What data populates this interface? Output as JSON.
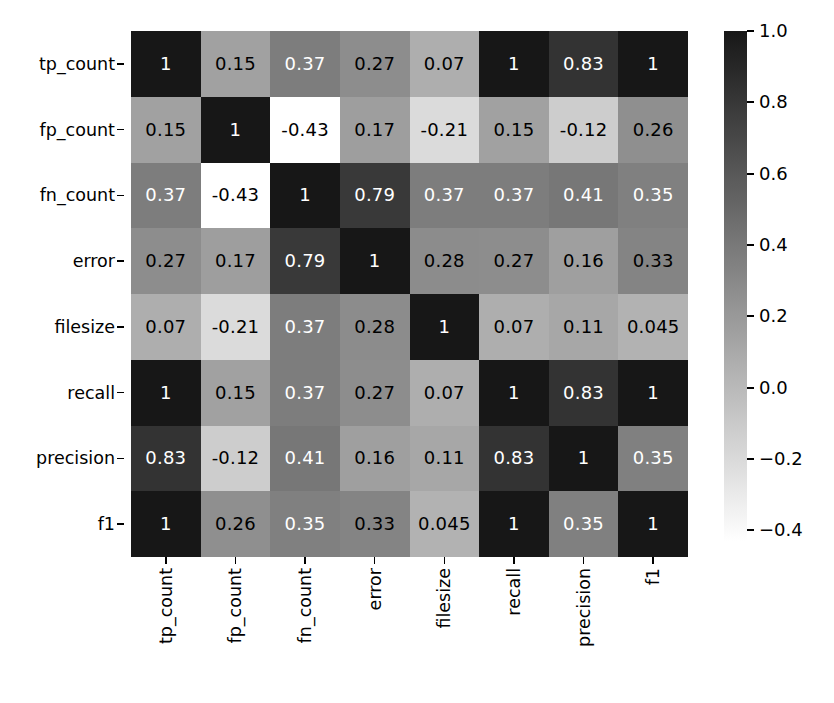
{
  "chart_data": {
    "type": "heatmap",
    "title": "",
    "xlabel": "",
    "ylabel": "",
    "grid": false,
    "colormap": "gray_r",
    "legend_position": "right",
    "categories": [
      "tp_count",
      "fp_count",
      "fn_count",
      "error",
      "filesize",
      "recall",
      "precision",
      "f1"
    ],
    "x_categories": [
      "tp_count",
      "fp_count",
      "fn_count",
      "error",
      "filesize",
      "recall",
      "precision",
      "f1"
    ],
    "y_categories": [
      "tp_count",
      "fp_count",
      "fn_count",
      "error",
      "filesize",
      "recall",
      "precision",
      "f1"
    ],
    "xtick_rotation": 90,
    "values": [
      [
        1,
        0.15,
        0.37,
        0.27,
        0.07,
        1,
        0.83,
        1
      ],
      [
        0.15,
        1,
        -0.43,
        0.17,
        -0.21,
        0.15,
        -0.12,
        0.26
      ],
      [
        0.37,
        -0.43,
        1,
        0.79,
        0.37,
        0.37,
        0.41,
        0.35
      ],
      [
        0.27,
        0.17,
        0.79,
        1,
        0.28,
        0.27,
        0.16,
        0.33
      ],
      [
        0.07,
        -0.21,
        0.37,
        0.28,
        1,
        0.07,
        0.11,
        0.045
      ],
      [
        1,
        0.15,
        0.37,
        0.27,
        0.07,
        1,
        0.83,
        1
      ],
      [
        0.83,
        -0.12,
        0.41,
        0.16,
        0.11,
        0.83,
        1,
        0.35
      ],
      [
        1,
        0.26,
        0.35,
        0.33,
        0.045,
        1,
        0.35,
        1
      ]
    ],
    "annotations": [
      [
        "1",
        "0.15",
        "0.37",
        "0.27",
        "0.07",
        "1",
        "0.83",
        "1"
      ],
      [
        "0.15",
        "1",
        "-0.43",
        "0.17",
        "-0.21",
        "0.15",
        "-0.12",
        "0.26"
      ],
      [
        "0.37",
        "-0.43",
        "1",
        "0.79",
        "0.37",
        "0.37",
        "0.41",
        "0.35"
      ],
      [
        "0.27",
        "0.17",
        "0.79",
        "1",
        "0.28",
        "0.27",
        "0.16",
        "0.33"
      ],
      [
        "0.07",
        "-0.21",
        "0.37",
        "0.28",
        "1",
        "0.07",
        "0.11",
        "0.045"
      ],
      [
        "1",
        "0.15",
        "0.37",
        "0.27",
        "0.07",
        "1",
        "0.83",
        "1"
      ],
      [
        "0.83",
        "-0.12",
        "0.41",
        "0.16",
        "0.11",
        "0.83",
        "1",
        "0.35"
      ],
      [
        "1",
        "0.26",
        "0.35",
        "0.33",
        "0.045",
        "1",
        "0.35",
        "1"
      ]
    ],
    "colorbar": {
      "vmin": -0.43,
      "vmax": 1.0,
      "ticks": [
        1.0,
        0.8,
        0.6,
        0.4,
        0.2,
        0.0,
        -0.2,
        -0.4
      ],
      "tick_labels": [
        "1.0",
        "0.8",
        "0.6",
        "0.4",
        "0.2",
        "0.0",
        "−0.2",
        "−0.4"
      ],
      "low_color": "#ffffff",
      "high_color": "#1a1a1a"
    }
  }
}
